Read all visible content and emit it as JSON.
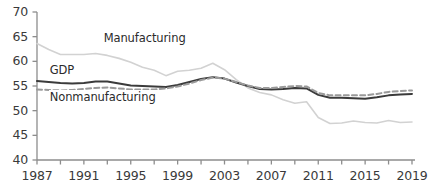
{
  "chart_data": {
    "type": "line",
    "title": "",
    "subtitle": "",
    "xlabel": "",
    "ylabel": "",
    "xlim": [
      1987,
      2019
    ],
    "ylim": [
      40,
      70
    ],
    "grid": false,
    "legend_position": "inline-annotations",
    "y_ticks": [
      40,
      45,
      50,
      55,
      60,
      65,
      70
    ],
    "x_ticks": [
      1987,
      1989,
      1991,
      1993,
      1995,
      1997,
      1999,
      2001,
      2003,
      2005,
      2007,
      2009,
      2011,
      2013,
      2015,
      2017,
      2019
    ],
    "x_tick_labels": [
      "1987",
      "",
      "1991",
      "",
      "1995",
      "",
      "1999",
      "",
      "2003",
      "",
      "2007",
      "",
      "2011",
      "",
      "2015",
      "",
      "2019"
    ],
    "x": [
      1987,
      1988,
      1989,
      1990,
      1991,
      1992,
      1993,
      1994,
      1995,
      1996,
      1997,
      1998,
      1999,
      2000,
      2001,
      2002,
      2003,
      2004,
      2005,
      2006,
      2007,
      2008,
      2009,
      2010,
      2011,
      2012,
      2013,
      2014,
      2015,
      2016,
      2017,
      2018,
      2019
    ],
    "series": [
      {
        "name": "Manufacturing",
        "color": "#d2d2d2",
        "style": "solid",
        "width": 1.6,
        "label_x": 1992.6,
        "label_y": 64.6,
        "values": [
          63.6,
          62.4,
          61.4,
          61.4,
          61.4,
          61.6,
          61.2,
          60.6,
          59.8,
          58.8,
          58.2,
          57.1,
          58.0,
          58.2,
          58.6,
          59.6,
          58.3,
          56.3,
          54.6,
          53.7,
          53.2,
          52.2,
          51.5,
          51.8,
          48.6,
          47.4,
          47.5,
          47.9,
          47.6,
          47.5,
          48.0,
          47.6,
          47.7
        ]
      },
      {
        "name": "GDP",
        "color": "#3b3b3b",
        "style": "solid",
        "width": 2.0,
        "label_x": 1988.0,
        "label_y": 58.1,
        "values": [
          56.0,
          55.8,
          55.6,
          55.5,
          55.6,
          55.9,
          55.9,
          55.5,
          55.1,
          55.0,
          54.9,
          54.8,
          55.2,
          55.8,
          56.4,
          56.8,
          56.5,
          55.7,
          55.0,
          54.4,
          54.3,
          54.4,
          54.6,
          54.5,
          53.2,
          52.6,
          52.6,
          52.5,
          52.4,
          52.7,
          53.1,
          53.3,
          53.4
        ]
      },
      {
        "name": "Nonmanufacturing",
        "color": "#9a9a9a",
        "style": "dashed",
        "width": 2.0,
        "label_x": 1988.0,
        "label_y": 52.6,
        "values": [
          54.3,
          54.2,
          54.1,
          54.2,
          54.4,
          54.6,
          54.7,
          54.5,
          54.3,
          54.3,
          54.3,
          54.5,
          54.9,
          55.5,
          56.2,
          56.7,
          56.5,
          55.8,
          55.1,
          54.6,
          54.6,
          54.8,
          55.0,
          54.9,
          53.6,
          53.1,
          53.1,
          53.1,
          53.1,
          53.4,
          53.8,
          54.0,
          54.1
        ]
      }
    ]
  }
}
